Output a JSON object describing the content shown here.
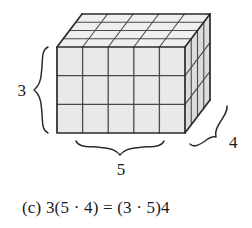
{
  "figure": {
    "caption": "(c) 3(5 · 4) = (3 · 5)4",
    "caption_letter": "(c)",
    "equation": "3(5 · 4) = (3 · 5)4",
    "alt": "Rectangular prism of unit cubes, 5 wide by 3 high by 4 deep, with braces labeling the height 3, the width 5, and the depth 4"
  },
  "labels": {
    "height": "3",
    "width": "5",
    "depth": "4"
  },
  "solid": {
    "name": "rectangular-prism-of-unit-cubes",
    "width_units": 5,
    "height_units": 3,
    "depth_units": 4,
    "total_cubes": 60
  },
  "colors": {
    "front_face": "#e9e9e9",
    "top_face": "#efefef",
    "right_face": "#dcdcdc",
    "outline": "#2b2b2b",
    "gridline": "#4a4a4a",
    "brace": "#2b2b2b",
    "text": "#1a1a1a",
    "background": "#ffffff"
  },
  "icons": {
    "brace_left": "curly-brace-left-icon",
    "brace_bottom": "curly-brace-bottom-icon",
    "brace_diagonal": "curly-brace-diagonal-icon"
  }
}
